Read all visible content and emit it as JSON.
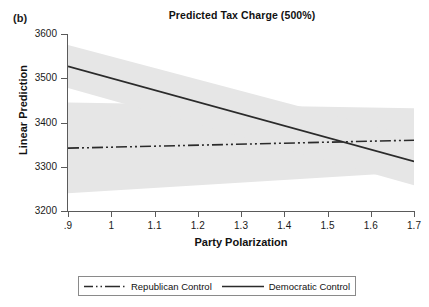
{
  "panel": {
    "label": "(b)"
  },
  "chart_data": {
    "type": "line",
    "title": "Predicted Tax Charge (500%)",
    "xlabel": "Party Polarization",
    "ylabel": "Linear Prediction",
    "xlim": [
      0.9,
      1.7
    ],
    "ylim": [
      3200,
      3600
    ],
    "xticks": [
      ".9",
      "1",
      "1.1",
      "1.2",
      "1.3",
      "1.4",
      "1.5",
      "1.6",
      "1.7"
    ],
    "xtick_values": [
      0.9,
      1.0,
      1.1,
      1.2,
      1.3,
      1.4,
      1.5,
      1.6,
      1.7
    ],
    "yticks": [
      "3600",
      "3500",
      "3400",
      "3300",
      "3200"
    ],
    "ytick_values": [
      3600,
      3500,
      3400,
      3300,
      3200
    ],
    "grid": false,
    "legend_position": "below-center",
    "series": [
      {
        "name": "Republican Control",
        "style": "dash-dot-dot",
        "color": "#2b2b2b",
        "x": [
          0.9,
          1.7
        ],
        "values": [
          3342,
          3360
        ],
        "ci_lower": [
          3240,
          3288
        ],
        "ci_upper": [
          3445,
          3432
        ]
      },
      {
        "name": "Democratic Control",
        "style": "solid",
        "color": "#2b2b2b",
        "x": [
          0.9,
          1.7
        ],
        "values": [
          3527,
          3312
        ],
        "ci_lower": [
          3478,
          3258
        ],
        "ci_upper": [
          3575,
          3368
        ]
      }
    ],
    "band_color": "#e6e6e6",
    "annotations": []
  },
  "legend": {
    "entries": [
      {
        "label": "Republican Control",
        "style": "dash-dot-dot"
      },
      {
        "label": "Democratic Control",
        "style": "solid"
      }
    ]
  }
}
